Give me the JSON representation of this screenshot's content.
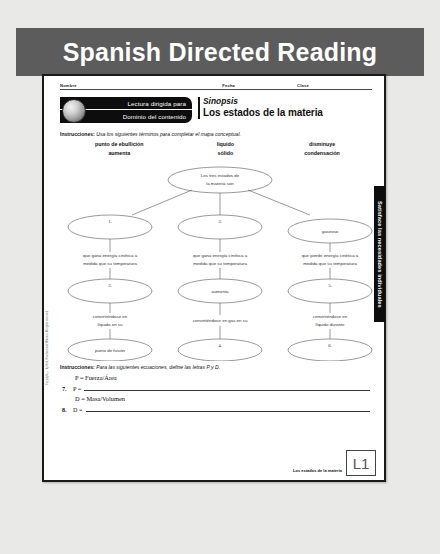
{
  "banner": {
    "title": "Spanish Directed Reading"
  },
  "worksheet": {
    "meta": {
      "nombre": "Nombre",
      "fecha": "Fecha",
      "clase": "Clase"
    },
    "logo": {
      "line1": "Lectura dirigida para",
      "line2": "Dominio del contenido",
      "sphere_icon": "sphere-icon"
    },
    "title": {
      "eyebrow": "Sinopsis",
      "main": "Los estados de la materia"
    },
    "instructions_1": {
      "label": "Instrucciones:",
      "text": "Usa los siguientes términos para completar el mapa conceptual."
    },
    "word_bank": [
      [
        "punto de ebullición",
        "líquido",
        "disminuye"
      ],
      [
        "aumenta",
        "sólido",
        "condensación"
      ]
    ],
    "concept_map": {
      "root": "Los tres estados de la materia son",
      "columns": [
        {
          "state_oval": "",
          "state_number": "1.",
          "link_1": "que gana energía cinética a medida que su temperatura",
          "middle_oval": "",
          "middle_number": "2.",
          "link_2": "convirtiéndose en líquido en su",
          "end_oval": "punto de fusión",
          "end_number": ""
        },
        {
          "state_oval": "",
          "state_number": "3.",
          "link_1": "que gana energía cinética a medida que su temperatura",
          "middle_oval": "aumenta",
          "middle_number": "",
          "link_2": "convirtiéndose en gas en su",
          "end_oval": "",
          "end_number": "4."
        },
        {
          "state_oval": "gaseoso",
          "state_number": "",
          "link_1": "que pierde energía cinética a medida que su temperatura",
          "middle_oval": "",
          "middle_number": "5.",
          "link_2": "convirtiéndose en líquido durante",
          "end_oval": "",
          "end_number": "6."
        }
      ]
    },
    "instructions_2": {
      "label": "Instrucciones:",
      "text": "Para las siguientes ecuaciones, define las letras P y D."
    },
    "equations": [
      {
        "number": "",
        "formula": "P = Fuerza/Área",
        "answer_number": "7.",
        "answer_prompt": "P ="
      },
      {
        "number": "",
        "formula": "D = Masa/Volumen",
        "answer_number": "8.",
        "answer_prompt": "D ="
      }
    ],
    "footer": {
      "text": "Los estados de la materia",
      "level_box": "L1"
    },
    "side_tab": "Satisface las necesidades individuales",
    "copyright": "Copyright © by Holt, Rinehart and Winston. All rights reserved."
  }
}
